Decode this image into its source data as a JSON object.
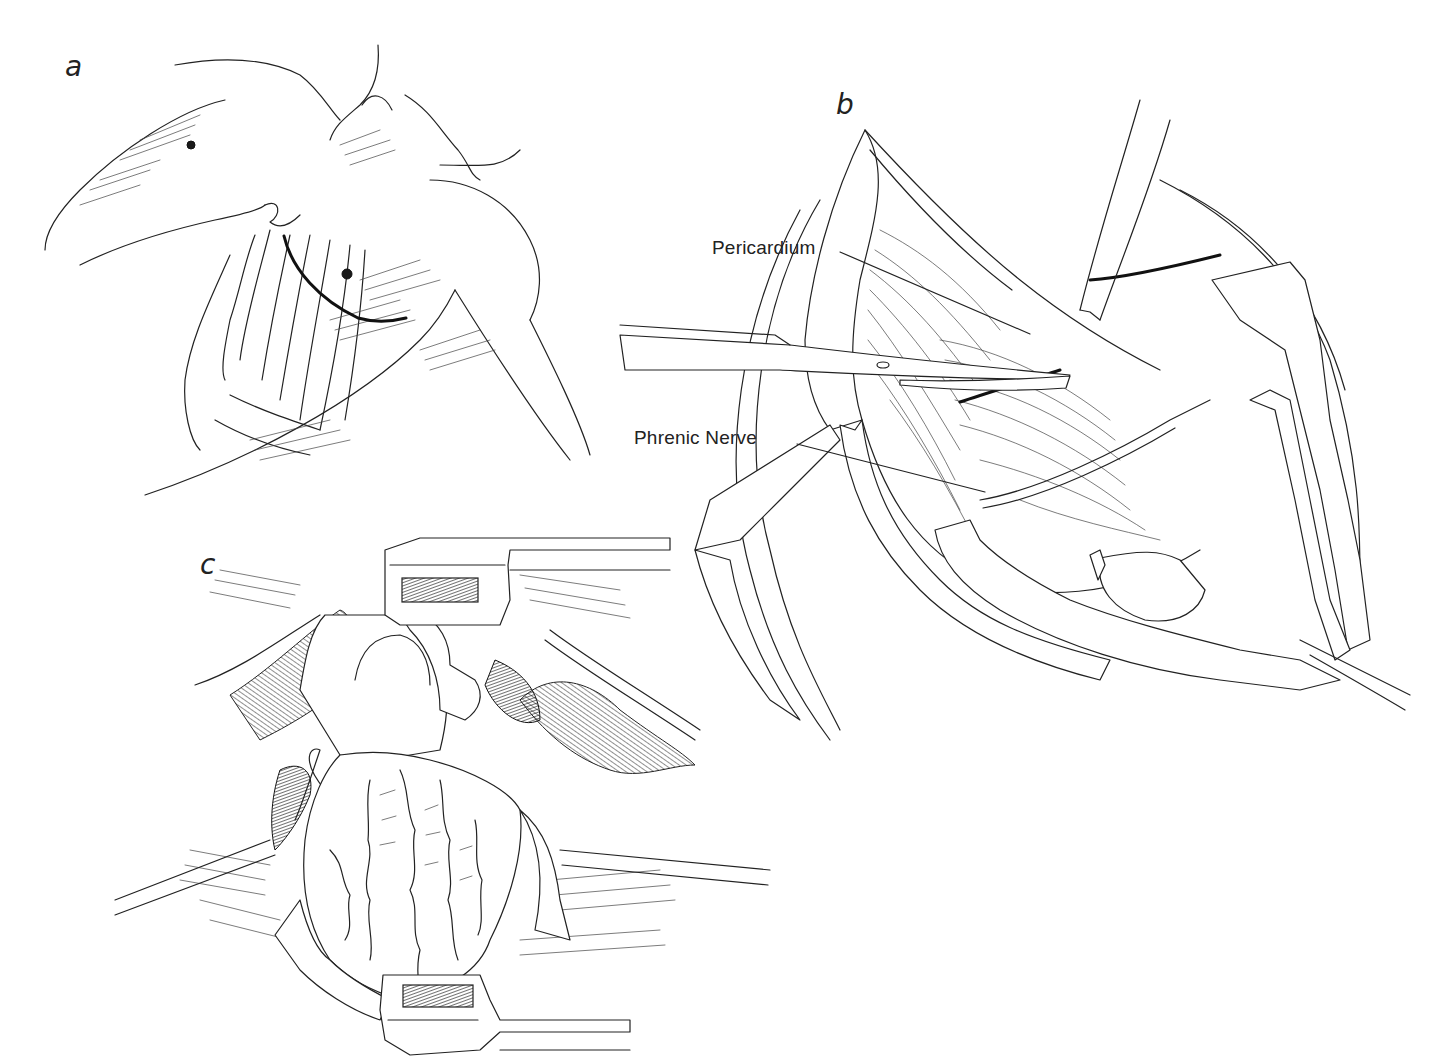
{
  "figure": {
    "panels": [
      {
        "id": "a",
        "letter": "a",
        "subject": "patient positioning with incision line on left chest"
      },
      {
        "id": "b",
        "letter": "b",
        "subject": "pericardium being opened anterior to the phrenic nerve",
        "callouts": [
          {
            "label": "Pericardium"
          },
          {
            "label": "Phrenic Nerve"
          }
        ]
      },
      {
        "id": "c",
        "letter": "c",
        "subject": "exposed heart with retractors in place"
      }
    ],
    "colors": {
      "ink": "#222222",
      "background": "#ffffff"
    }
  }
}
